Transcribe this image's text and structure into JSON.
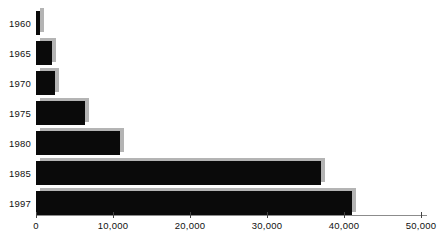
{
  "chart_data": {
    "type": "bar",
    "orientation": "horizontal",
    "title": "",
    "subtitle": "",
    "xlabel": "",
    "ylabel": "",
    "categories": [
      "1960",
      "1965",
      "1970",
      "1975",
      "1980",
      "1985",
      "1997"
    ],
    "values": [
      500,
      2100,
      2500,
      6400,
      10900,
      37000,
      41000
    ],
    "xlim": [
      0,
      50000
    ],
    "xticks": [
      0,
      10000,
      20000,
      30000,
      40000,
      50000
    ],
    "xtick_labels": [
      "0",
      "10,000",
      "20,000",
      "30,000",
      "40,000",
      "50,000"
    ],
    "grid": false,
    "legend": false,
    "series": [
      {
        "name": "",
        "values": [
          500,
          2100,
          2500,
          6400,
          10900,
          37000,
          41000
        ]
      }
    ],
    "bars": [
      {
        "category": "1960",
        "value": 500
      },
      {
        "category": "1965",
        "value": 2100
      },
      {
        "category": "1970",
        "value": 2500
      },
      {
        "category": "1975",
        "value": 6400
      },
      {
        "category": "1980",
        "value": 10900
      },
      {
        "category": "1985",
        "value": 37000
      },
      {
        "category": "1997",
        "value": 41000
      }
    ],
    "colors": {
      "bar": "#0a0a0a",
      "bar_shadow": "#b4b4b4",
      "axis": "#8c8c8c",
      "text": "#111111",
      "background": "#ffffff"
    }
  },
  "geometry": {
    "origin_x": 36,
    "px_per_unit": 0.0077,
    "row_height": 30,
    "first_row_top": 8,
    "bar_height": 24,
    "axis_y": 215
  }
}
